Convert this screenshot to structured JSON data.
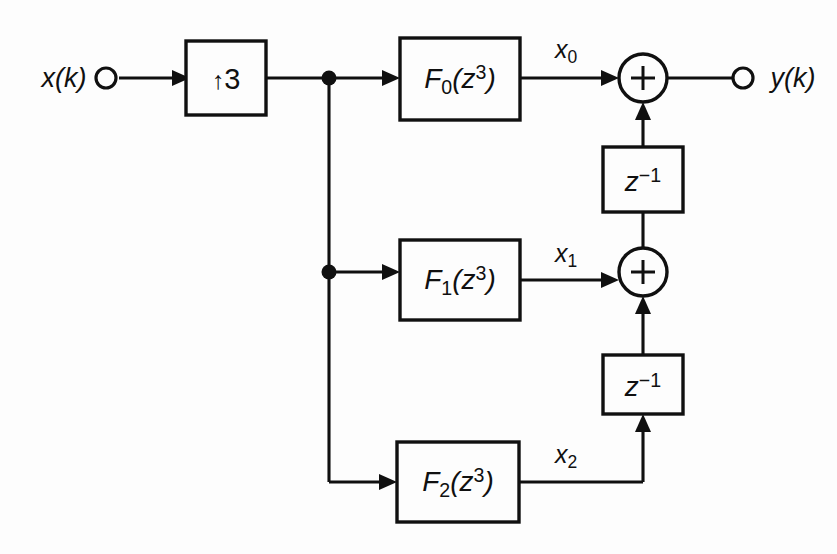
{
  "diagram": {
    "type": "signal-flow-block-diagram",
    "background_color": "#fdfdfd",
    "line_color": "#101010",
    "input": {
      "label": "x(k)",
      "terminal": "open-circle"
    },
    "output": {
      "label": "y(k)",
      "terminal": "open-circle"
    },
    "upsampler": {
      "arrow_glyph": "↑",
      "factor": "3",
      "label": "↑3"
    },
    "filters": [
      {
        "base": "F",
        "sub": "0",
        "arg": "(z",
        "sup": "3",
        "close": ")",
        "label": "F0(z3)",
        "out_base": "x",
        "out_sub": "0",
        "out_label": "x0"
      },
      {
        "base": "F",
        "sub": "1",
        "arg": "(z",
        "sup": "3",
        "close": ")",
        "label": "F1(z3)",
        "out_base": "x",
        "out_sub": "1",
        "out_label": "x1"
      },
      {
        "base": "F",
        "sub": "2",
        "arg": "(z",
        "sup": "3",
        "close": ")",
        "label": "F2(z3)",
        "out_base": "x",
        "out_sub": "2",
        "out_label": "x2"
      }
    ],
    "delays": [
      {
        "base": "z",
        "sup": "−1",
        "label": "z-1",
        "position": "upper"
      },
      {
        "base": "z",
        "sup": "−1",
        "label": "z-1",
        "position": "lower"
      }
    ],
    "adders": [
      {
        "sign": "+",
        "position": "upper"
      },
      {
        "sign": "+",
        "position": "lower"
      }
    ],
    "junctions": [
      {
        "name": "tap-top"
      },
      {
        "name": "tap-middle"
      }
    ]
  }
}
